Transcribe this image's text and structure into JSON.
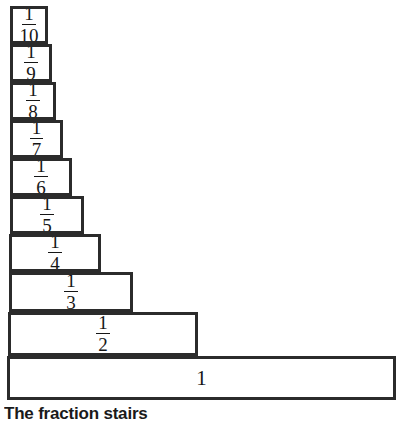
{
  "figure": {
    "caption": "The fraction stairs",
    "background_color": "#ffffff",
    "stroke_color": "#2b2b2b",
    "text_color": "#161616"
  },
  "chart_data": {
    "type": "bar",
    "orientation": "horizontal",
    "title": "The fraction stairs",
    "xlabel": "",
    "ylabel": "",
    "grid": false,
    "legend": false,
    "categories": [
      "1/10",
      "1/9",
      "1/8",
      "1/7",
      "1/6",
      "1/5",
      "1/4",
      "1/3",
      "1/2",
      "1"
    ],
    "values": [
      0.1,
      0.1111,
      0.125,
      0.1429,
      0.1667,
      0.2,
      0.25,
      0.3333,
      0.5,
      1
    ],
    "xlim": [
      0,
      1
    ],
    "bars": [
      {
        "label": "1/10",
        "numerator": "1",
        "denominator": "10",
        "value": 0.1,
        "left": 10,
        "top": 6,
        "width": 38,
        "height": 38
      },
      {
        "label": "1/9",
        "numerator": "1",
        "denominator": "9",
        "value": 0.1111,
        "left": 10,
        "top": 44,
        "width": 42,
        "height": 38
      },
      {
        "label": "1/8",
        "numerator": "1",
        "denominator": "8",
        "value": 0.125,
        "left": 10,
        "top": 82,
        "width": 46,
        "height": 38
      },
      {
        "label": "1/7",
        "numerator": "1",
        "denominator": "7",
        "value": 0.1429,
        "left": 10,
        "top": 120,
        "width": 53,
        "height": 38
      },
      {
        "label": "1/6",
        "numerator": "1",
        "denominator": "6",
        "value": 0.1667,
        "left": 10,
        "top": 158,
        "width": 62,
        "height": 38
      },
      {
        "label": "1/5",
        "numerator": "1",
        "denominator": "5",
        "value": 0.2,
        "left": 10,
        "top": 196,
        "width": 74,
        "height": 38
      },
      {
        "label": "1/4",
        "numerator": "1",
        "denominator": "4",
        "value": 0.25,
        "left": 9,
        "top": 234,
        "width": 92,
        "height": 38
      },
      {
        "label": "1/3",
        "numerator": "1",
        "denominator": "3",
        "value": 0.3333,
        "left": 9,
        "top": 272,
        "width": 124,
        "height": 40
      },
      {
        "label": "1/2",
        "numerator": "1",
        "denominator": "2",
        "value": 0.5,
        "left": 8,
        "top": 312,
        "width": 190,
        "height": 44
      },
      {
        "label": "1",
        "numerator": "",
        "denominator": "",
        "value": 1,
        "left": 7,
        "top": 356,
        "width": 389,
        "height": 44
      }
    ]
  }
}
